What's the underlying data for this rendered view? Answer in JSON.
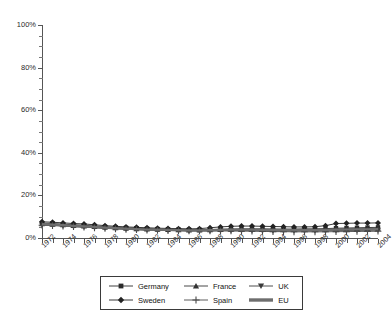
{
  "chart_data": {
    "type": "line",
    "title": "",
    "subtitle": "",
    "xlabel": "",
    "ylabel": "",
    "xlim": [
      1972,
      2004
    ],
    "ylim": [
      0,
      100
    ],
    "y_tick_format": "percent",
    "grid": false,
    "legend_position": "bottom",
    "x": [
      1972,
      1973,
      1974,
      1975,
      1976,
      1977,
      1978,
      1979,
      1980,
      1981,
      1982,
      1983,
      1984,
      1985,
      1986,
      1987,
      1988,
      1989,
      1990,
      1991,
      1992,
      1993,
      1994,
      1995,
      1996,
      1997,
      1998,
      1999,
      2000,
      2001,
      2002,
      2003,
      2004
    ],
    "x_tick_labels": [
      "1972",
      "1974",
      "1976",
      "1978",
      "1980",
      "1982",
      "1984",
      "1986",
      "1988",
      "1990",
      "1992",
      "1994",
      "1996",
      "1998",
      "2000",
      "2002",
      "2004"
    ],
    "y_tick_labels": [
      "0%",
      "20%",
      "40%",
      "60%",
      "80%",
      "100%"
    ],
    "y_tick_values": [
      0,
      20,
      40,
      60,
      80,
      100
    ],
    "y_minor_tick_step": 5,
    "series": [
      {
        "name": "Germany",
        "marker": "square",
        "color": "#2b2b2b",
        "values": [
          7.0,
          6.8,
          6.5,
          6.2,
          6.0,
          5.6,
          5.3,
          5.0,
          4.8,
          4.6,
          4.4,
          4.2,
          4.1,
          4.0,
          3.9,
          3.9,
          4.0,
          4.1,
          4.2,
          4.3,
          4.3,
          4.3,
          4.2,
          4.2,
          4.2,
          4.3,
          4.3,
          4.4,
          4.6,
          4.7,
          4.8,
          4.9,
          5.0
        ]
      },
      {
        "name": "France",
        "marker": "triangle-up",
        "color": "#333333",
        "values": [
          6.6,
          6.4,
          6.1,
          5.8,
          5.6,
          5.3,
          5.0,
          4.7,
          4.5,
          4.3,
          4.1,
          4.0,
          3.9,
          3.8,
          3.7,
          3.7,
          3.8,
          3.9,
          4.0,
          4.0,
          4.0,
          4.0,
          3.9,
          3.9,
          3.9,
          4.0,
          4.0,
          4.1,
          4.2,
          4.3,
          4.4,
          4.4,
          4.5
        ]
      },
      {
        "name": "UK",
        "marker": "triangle-down",
        "color": "#3a3a3a",
        "values": [
          6.2,
          6.0,
          5.7,
          5.4,
          5.2,
          4.9,
          4.6,
          4.4,
          4.2,
          4.0,
          3.8,
          3.7,
          3.6,
          3.5,
          3.4,
          3.4,
          3.4,
          3.5,
          3.5,
          3.5,
          3.5,
          3.4,
          3.4,
          3.3,
          3.3,
          3.3,
          3.3,
          3.4,
          3.5,
          3.5,
          3.6,
          3.6,
          3.7
        ]
      },
      {
        "name": "Sweden",
        "marker": "diamond",
        "color": "#222222",
        "values": [
          7.6,
          7.4,
          7.1,
          6.8,
          6.6,
          6.2,
          5.8,
          5.5,
          5.2,
          5.0,
          4.8,
          4.6,
          4.5,
          4.4,
          4.3,
          4.4,
          4.8,
          5.2,
          5.5,
          5.6,
          5.6,
          5.5,
          5.4,
          5.3,
          5.2,
          5.2,
          5.3,
          5.8,
          6.8,
          6.9,
          7.0,
          7.0,
          7.1
        ]
      },
      {
        "name": "Spain",
        "marker": "plus",
        "color": "#4a4a4a",
        "values": [
          6.0,
          5.8,
          5.6,
          5.3,
          5.1,
          4.8,
          4.5,
          4.3,
          4.1,
          3.9,
          3.7,
          3.6,
          3.5,
          3.4,
          3.3,
          3.3,
          3.3,
          3.3,
          3.3,
          3.2,
          3.2,
          3.1,
          3.0,
          3.0,
          2.9,
          2.9,
          2.9,
          2.9,
          3.0,
          3.0,
          3.1,
          3.1,
          3.2
        ]
      },
      {
        "name": "EU",
        "marker": "none",
        "color": "#6e6e6e",
        "values": [
          6.5,
          6.3,
          6.0,
          5.7,
          5.5,
          5.2,
          4.9,
          4.6,
          4.4,
          4.2,
          4.0,
          3.9,
          3.8,
          3.7,
          3.6,
          3.6,
          3.7,
          3.8,
          3.9,
          3.9,
          3.9,
          3.8,
          3.8,
          3.7,
          3.7,
          3.7,
          3.7,
          3.8,
          3.9,
          4.0,
          4.1,
          4.1,
          4.2
        ]
      }
    ]
  },
  "legend": {
    "entries": [
      {
        "label": "Germany",
        "marker": "square"
      },
      {
        "label": "France",
        "marker": "triangle-up"
      },
      {
        "label": "UK",
        "marker": "triangle-down"
      },
      {
        "label": "Sweden",
        "marker": "diamond"
      },
      {
        "label": "Spain",
        "marker": "plus"
      },
      {
        "label": "EU",
        "marker": "none"
      }
    ]
  }
}
